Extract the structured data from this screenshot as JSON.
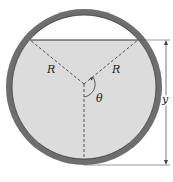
{
  "diagram": {
    "labels": {
      "radius_left": "R",
      "radius_right": "R",
      "angle": "θ",
      "depth": "y"
    },
    "colors": {
      "ring": "#6e6e6e",
      "fluid": "#dcdcdc",
      "empty": "#ffffff",
      "line": "#333333"
    }
  }
}
